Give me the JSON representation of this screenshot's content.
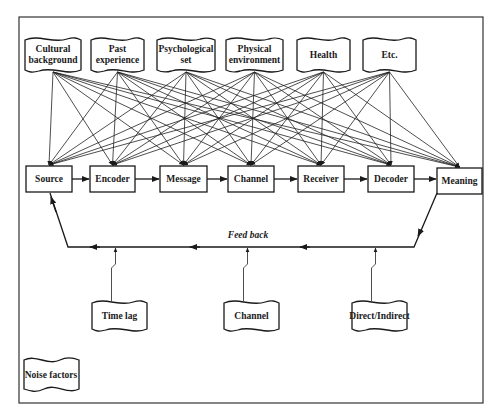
{
  "diagram": {
    "factors": [
      {
        "line1": "Cultural",
        "line2": "background"
      },
      {
        "line1": "Past",
        "line2": "experience"
      },
      {
        "line1": "Psychological",
        "line2": "set"
      },
      {
        "line1": "Physical",
        "line2": "environment"
      },
      {
        "line1": "Health",
        "line2": ""
      },
      {
        "line1": "Etc.",
        "line2": ""
      }
    ],
    "process": [
      {
        "label": "Source"
      },
      {
        "label": "Encoder"
      },
      {
        "label": "Message"
      },
      {
        "label": "Channel"
      },
      {
        "label": "Receiver"
      },
      {
        "label": "Decoder"
      },
      {
        "label": "Meaning"
      }
    ],
    "feedback_label": "Feed back",
    "feedback_factors": [
      {
        "label": "Time lag"
      },
      {
        "label": "Channel"
      },
      {
        "label": "Direct/Indirect"
      }
    ],
    "legend_label": "Noise factors"
  }
}
